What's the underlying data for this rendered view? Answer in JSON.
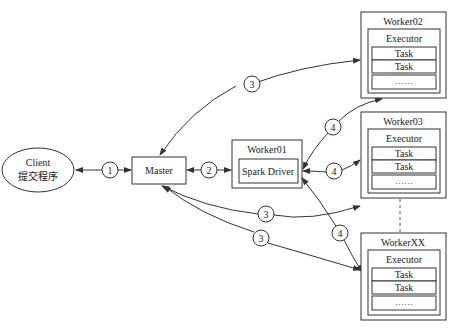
{
  "diagram": {
    "colors": {
      "stroke": "#333333",
      "background": "#ffffff",
      "text": "#222222"
    },
    "client": {
      "line1": "Client",
      "line2": "提交程序"
    },
    "master": {
      "label": "Master"
    },
    "worker01": {
      "title": "Worker01",
      "driver": "Spark Driver"
    },
    "workers": [
      {
        "title": "Worker02",
        "executor": "Executor",
        "tasks": [
          "Task",
          "Task"
        ],
        "more": "……"
      },
      {
        "title": "Worker03",
        "executor": "Executor",
        "tasks": [
          "Task",
          "Task"
        ],
        "more": "……"
      },
      {
        "title": "WorkerXX",
        "executor": "Executor",
        "tasks": [
          "Task",
          "Task"
        ],
        "more": "……"
      }
    ],
    "steps": {
      "s1": "1",
      "s2": "2",
      "s3a": "3",
      "s3b": "3",
      "s3c": "3",
      "s4a": "4",
      "s4b": "4",
      "s4c": "4"
    }
  }
}
